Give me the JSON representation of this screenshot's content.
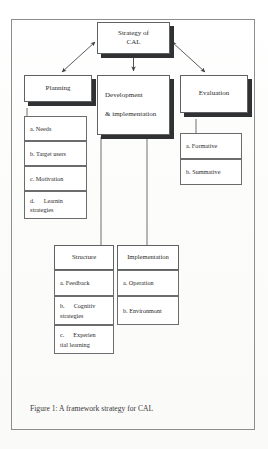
{
  "figure": {
    "caption": "Figure 1: A framework strategy for CAL",
    "root": {
      "line1": "Strategy of",
      "line2": "CAL"
    },
    "branches": [
      {
        "title": "Planning",
        "items": [
          {
            "label": "a. Needs"
          },
          {
            "label": "b. Target users"
          },
          {
            "label": "c. Motivation"
          },
          {
            "label": "d.",
            "label2": "Learnin",
            "label3": "strategies"
          }
        ]
      },
      {
        "title_line1": "Development",
        "title_line2": "& implementation",
        "subcolumns": [
          {
            "title": "Structure",
            "items": [
              {
                "label": "a. Feedback"
              },
              {
                "label": "b.",
                "label2": "Cognitiv",
                "label3": "strategies"
              },
              {
                "label": "c.",
                "label2": "Experien",
                "label3": "tial learning"
              }
            ]
          },
          {
            "title": "Implementation",
            "items": [
              {
                "label": "a. Operation"
              },
              {
                "label": "b. Environmont"
              }
            ]
          }
        ]
      },
      {
        "title": "Evaluation",
        "items": [
          {
            "label": "a. Formative"
          },
          {
            "label": "b. Summative"
          }
        ]
      }
    ]
  },
  "colors": {
    "box_border": "#5f6163",
    "box_shadow": "#2f3133",
    "frame_border": "#8b8d8f",
    "connector": "#4a4c4e",
    "text": "#2b2b2b",
    "paper": "#fdfdfc"
  }
}
